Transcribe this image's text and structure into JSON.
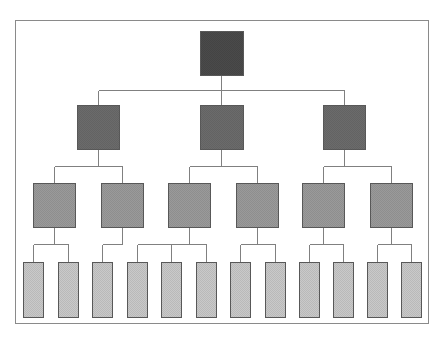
{
  "diagram": {
    "type": "hierarchy-tree",
    "levels": 4,
    "colors": {
      "frame": "#8a8a8a",
      "line": "#808080",
      "level1": "#4a4a4a",
      "level2": "#6b6b6b",
      "level3": "#9a9a9a",
      "level4": "#c9c9c9",
      "box_border": "#5a5a5a"
    },
    "nodes": [
      {
        "id": "n1",
        "level": 1,
        "parent": null,
        "cx": 221,
        "y": 31,
        "w": 43,
        "h": 44
      },
      {
        "id": "n2a",
        "level": 2,
        "parent": "n1",
        "cx": 98,
        "y": 105,
        "w": 42,
        "h": 44
      },
      {
        "id": "n2b",
        "level": 2,
        "parent": "n1",
        "cx": 221,
        "y": 105,
        "w": 43,
        "h": 44
      },
      {
        "id": "n2c",
        "level": 2,
        "parent": "n1",
        "cx": 344,
        "y": 105,
        "w": 42,
        "h": 44
      },
      {
        "id": "n3a",
        "level": 3,
        "parent": "n2a",
        "cx": 54,
        "y": 183,
        "w": 42,
        "h": 44
      },
      {
        "id": "n3b",
        "level": 3,
        "parent": "n2a",
        "cx": 122,
        "y": 183,
        "w": 42,
        "h": 44
      },
      {
        "id": "n3c",
        "level": 3,
        "parent": "n2b",
        "cx": 189,
        "y": 183,
        "w": 42,
        "h": 44
      },
      {
        "id": "n3d",
        "level": 3,
        "parent": "n2b",
        "cx": 257,
        "y": 183,
        "w": 42,
        "h": 44
      },
      {
        "id": "n3e",
        "level": 3,
        "parent": "n2c",
        "cx": 323,
        "y": 183,
        "w": 42,
        "h": 44
      },
      {
        "id": "n3f",
        "level": 3,
        "parent": "n2c",
        "cx": 391,
        "y": 183,
        "w": 42,
        "h": 44
      },
      {
        "id": "n4a",
        "level": 4,
        "parent": "n3a",
        "cx": 33,
        "y": 262,
        "w": 20,
        "h": 55
      },
      {
        "id": "n4b",
        "level": 4,
        "parent": "n3a",
        "cx": 68,
        "y": 262,
        "w": 20,
        "h": 55
      },
      {
        "id": "n4c",
        "level": 4,
        "parent": "n3b",
        "cx": 102,
        "y": 262,
        "w": 20,
        "h": 55
      },
      {
        "id": "n4d",
        "level": 4,
        "parent": "n3c",
        "cx": 137,
        "y": 262,
        "w": 20,
        "h": 55
      },
      {
        "id": "n4e",
        "level": 4,
        "parent": "n3c",
        "cx": 171,
        "y": 262,
        "w": 20,
        "h": 55
      },
      {
        "id": "n4f",
        "level": 4,
        "parent": "n3c",
        "cx": 206,
        "y": 262,
        "w": 20,
        "h": 55
      },
      {
        "id": "n4g",
        "level": 4,
        "parent": "n3d",
        "cx": 240,
        "y": 262,
        "w": 20,
        "h": 55
      },
      {
        "id": "n4h",
        "level": 4,
        "parent": "n3d",
        "cx": 275,
        "y": 262,
        "w": 20,
        "h": 55
      },
      {
        "id": "n4i",
        "level": 4,
        "parent": "n3e",
        "cx": 309,
        "y": 262,
        "w": 20,
        "h": 55
      },
      {
        "id": "n4j",
        "level": 4,
        "parent": "n3e",
        "cx": 343,
        "y": 262,
        "w": 20,
        "h": 55
      },
      {
        "id": "n4k",
        "level": 4,
        "parent": "n3f",
        "cx": 377,
        "y": 262,
        "w": 20,
        "h": 55
      },
      {
        "id": "n4l",
        "level": 4,
        "parent": "n3f",
        "cx": 411,
        "y": 262,
        "w": 20,
        "h": 55
      }
    ],
    "connector_y": {
      "2": 90,
      "3": 166,
      "4": 244
    }
  }
}
